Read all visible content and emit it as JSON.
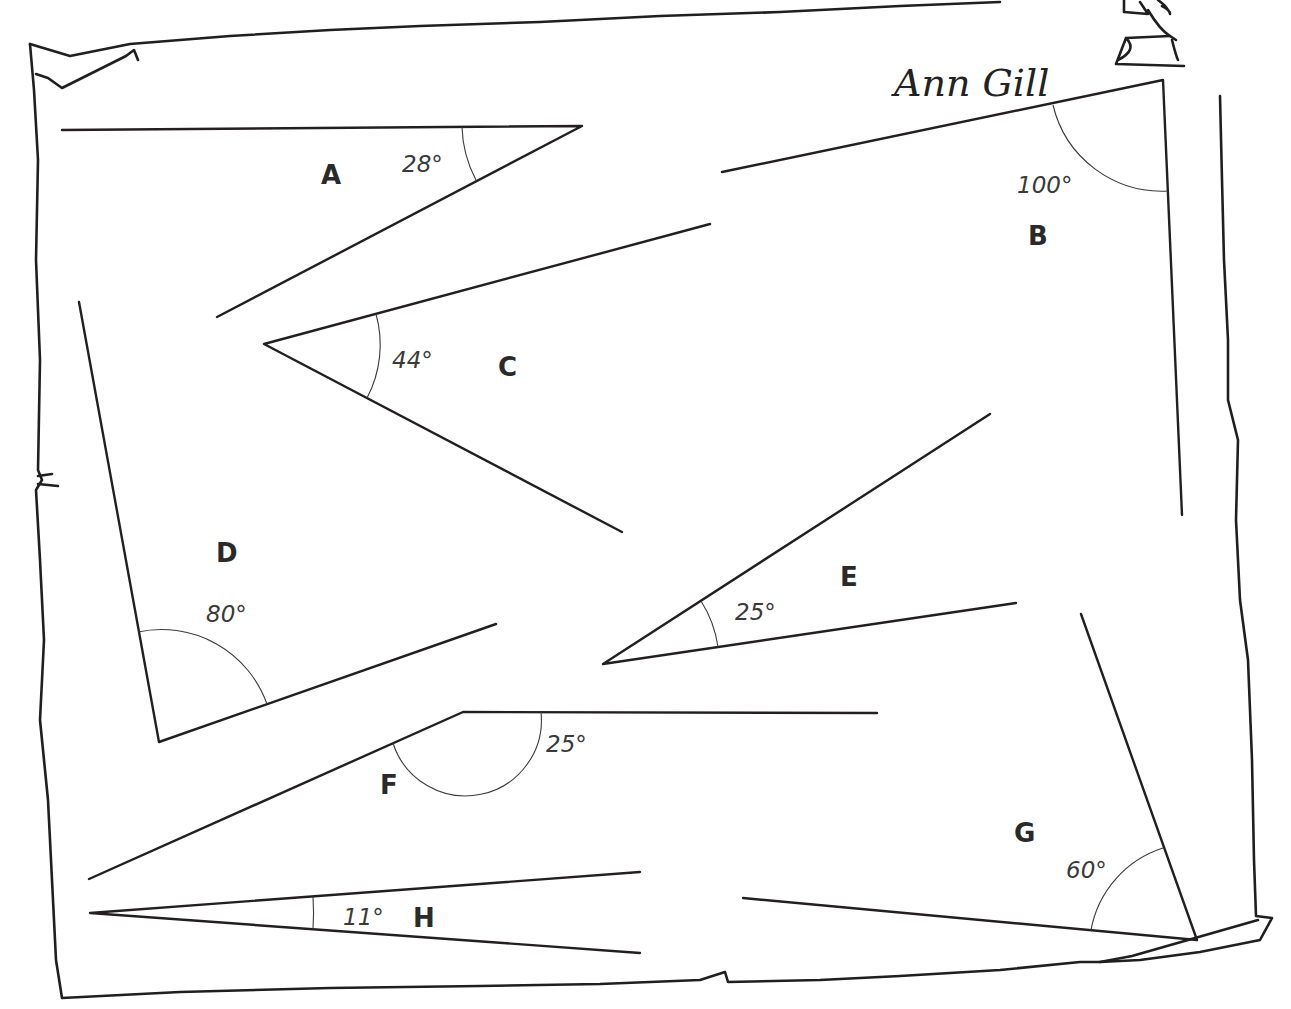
{
  "worksheet": {
    "author": "Ann Gill",
    "angles": [
      {
        "letter": "A",
        "measure": "28°",
        "degrees": 28
      },
      {
        "letter": "B",
        "measure": "100°",
        "degrees": 100
      },
      {
        "letter": "C",
        "measure": "44°",
        "degrees": 44
      },
      {
        "letter": "D",
        "measure": "80°",
        "degrees": 80
      },
      {
        "letter": "E",
        "measure": "25°",
        "degrees": 25
      },
      {
        "letter": "F",
        "measure": "25°",
        "degrees": 25
      },
      {
        "letter": "G",
        "measure": "60°",
        "degrees": 60
      },
      {
        "letter": "H",
        "measure": "11°",
        "degrees": 11
      }
    ]
  },
  "colors": {
    "ink": "#231f20",
    "paper": "#ffffff"
  }
}
